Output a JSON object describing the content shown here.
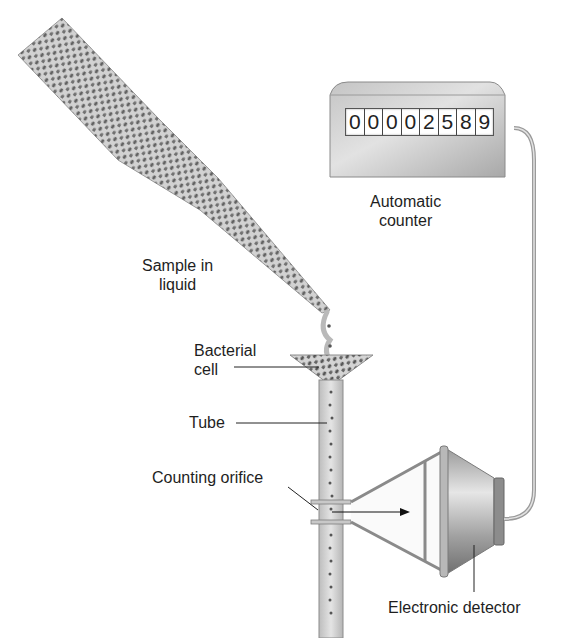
{
  "diagram": {
    "labels": {
      "sample": [
        "Sample in",
        "liquid"
      ],
      "bacterial_cell": [
        "Bacterial",
        "cell"
      ],
      "tube": "Tube",
      "counting_orifice": "Counting orifice",
      "automatic_counter": [
        "Automatic",
        "counter"
      ],
      "electronic_detector": "Electronic detector"
    },
    "counter": {
      "digits": [
        "0",
        "0",
        "0",
        "0",
        "2",
        "5",
        "8",
        "9"
      ],
      "reading": "00002589"
    },
    "colors": {
      "background": "#ffffff",
      "metal_light": "#d8d8d8",
      "metal_dark": "#8a8a8a",
      "cell_dots": "#555555",
      "liquid": "#cfcfcf",
      "text": "#1e1e1e"
    }
  }
}
